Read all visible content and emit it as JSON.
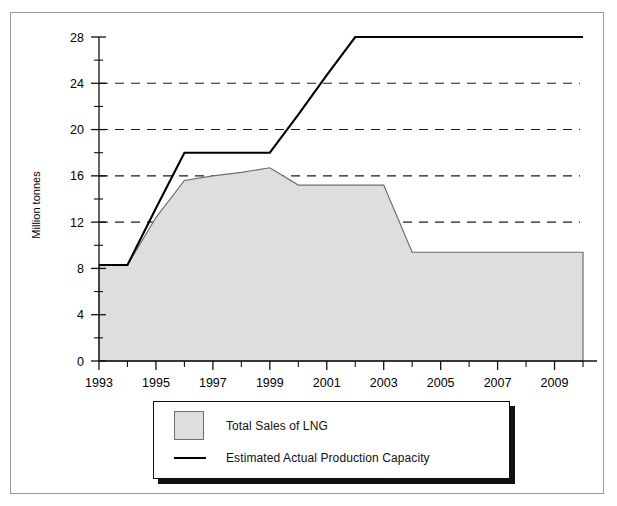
{
  "chart_data": {
    "type": "area",
    "title": "",
    "subtitle": "",
    "xlabel": "",
    "ylabel": "Million tonnes",
    "xlim": [
      1993,
      2010
    ],
    "ylim": [
      0,
      28
    ],
    "y_major_ticks": [
      0,
      4,
      8,
      12,
      16,
      20,
      24,
      28
    ],
    "y_minor_ticks": [
      2,
      6,
      10,
      14,
      18,
      22,
      26
    ],
    "y_tick_labels": [
      "0",
      "4",
      "8",
      "12",
      "16",
      "20",
      "24",
      "28"
    ],
    "x_tick_labels": [
      "1993",
      "1995",
      "1997",
      "1999",
      "2001",
      "2003",
      "2005",
      "2007",
      "2009"
    ],
    "x_tick_values": [
      1993,
      1995,
      1997,
      1999,
      2001,
      2003,
      2005,
      2007,
      2009
    ],
    "x_all_ticks": [
      1993,
      1994,
      1995,
      1996,
      1997,
      1998,
      1999,
      2000,
      2001,
      2002,
      2003,
      2004,
      2005,
      2006,
      2007,
      2008,
      2009,
      2010
    ],
    "grid": "horizontal-dashed",
    "gridlines": [
      12,
      16,
      20,
      24
    ],
    "legend_position": "bottom-center",
    "x": [
      1993,
      1994,
      1995,
      1996,
      1997,
      1998,
      1999,
      2000,
      2001,
      2002,
      2003,
      2004,
      2005,
      2006,
      2007,
      2008,
      2009,
      2010
    ],
    "series": [
      {
        "name": "Total Sales of LNG",
        "type": "area",
        "color": "#dedede",
        "edge_color": "#6d6d6d",
        "values": [
          8.3,
          8.3,
          12.4,
          15.6,
          16.0,
          16.3,
          16.7,
          15.2,
          15.2,
          15.2,
          15.2,
          9.4,
          9.4,
          9.4,
          9.4,
          9.4,
          9.4,
          9.4
        ]
      },
      {
        "name": "Estimated Actual Production Capacity",
        "type": "line",
        "color": "#000000",
        "values": [
          8.3,
          8.3,
          13.2,
          18.0,
          18.0,
          18.0,
          18.0,
          21.3,
          24.7,
          28.0,
          28.0,
          28.0,
          28.0,
          28.0,
          28.0,
          28.0,
          28.0,
          28.0
        ]
      }
    ]
  },
  "axis": {
    "ylabel": "Million tonnes"
  },
  "legend": {
    "items": [
      {
        "label": "Total Sales of LNG",
        "marker": "area-swatch"
      },
      {
        "label": "Estimated Actual Production Capacity",
        "marker": "line-swatch"
      }
    ]
  },
  "ticks": {
    "y": [
      "28",
      "24",
      "20",
      "16",
      "12",
      "8",
      "4",
      "0"
    ],
    "x": [
      "1993",
      "1995",
      "1997",
      "1999",
      "2001",
      "2003",
      "2005",
      "2007",
      "2009"
    ]
  }
}
